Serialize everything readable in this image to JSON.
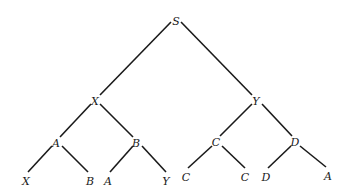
{
  "tree": {
    "nodes": [
      {
        "id": "n0",
        "label": "S",
        "x": 176,
        "y": 21
      },
      {
        "id": "n1",
        "label": "X",
        "x": 95,
        "y": 101
      },
      {
        "id": "n2",
        "label": "Y",
        "x": 256,
        "y": 101
      },
      {
        "id": "n3",
        "label": "A",
        "x": 56,
        "y": 143
      },
      {
        "id": "n4",
        "label": "B",
        "x": 136,
        "y": 143
      },
      {
        "id": "n5",
        "label": "C",
        "x": 216,
        "y": 142
      },
      {
        "id": "n6",
        "label": "D",
        "x": 295,
        "y": 142
      },
      {
        "id": "n7",
        "label": "X",
        "x": 26,
        "y": 181
      },
      {
        "id": "n8",
        "label": "B",
        "x": 90,
        "y": 181
      },
      {
        "id": "n9",
        "label": "A",
        "x": 108,
        "y": 181
      },
      {
        "id": "n10",
        "label": "Y",
        "x": 166,
        "y": 181
      },
      {
        "id": "n11",
        "label": "C",
        "x": 186,
        "y": 177
      },
      {
        "id": "n12",
        "label": "C",
        "x": 245,
        "y": 177
      },
      {
        "id": "n13",
        "label": "D",
        "x": 266,
        "y": 177
      },
      {
        "id": "n14",
        "label": "A",
        "x": 328,
        "y": 176
      }
    ],
    "edges": [
      {
        "x1": 171,
        "y1": 22,
        "x2": 100,
        "y2": 95
      },
      {
        "x1": 181,
        "y1": 22,
        "x2": 252,
        "y2": 95
      },
      {
        "x1": 91,
        "y1": 104,
        "x2": 60,
        "y2": 137
      },
      {
        "x1": 100,
        "y1": 104,
        "x2": 133,
        "y2": 137
      },
      {
        "x1": 252,
        "y1": 104,
        "x2": 220,
        "y2": 136
      },
      {
        "x1": 262,
        "y1": 104,
        "x2": 292,
        "y2": 136
      },
      {
        "x1": 52,
        "y1": 146,
        "x2": 28,
        "y2": 172
      },
      {
        "x1": 62,
        "y1": 146,
        "x2": 88,
        "y2": 172
      },
      {
        "x1": 133,
        "y1": 146,
        "x2": 110,
        "y2": 172
      },
      {
        "x1": 142,
        "y1": 146,
        "x2": 166,
        "y2": 172
      },
      {
        "x1": 212,
        "y1": 146,
        "x2": 188,
        "y2": 168
      },
      {
        "x1": 222,
        "y1": 146,
        "x2": 245,
        "y2": 168
      },
      {
        "x1": 291,
        "y1": 146,
        "x2": 268,
        "y2": 168
      },
      {
        "x1": 300,
        "y1": 146,
        "x2": 326,
        "y2": 167
      }
    ]
  }
}
